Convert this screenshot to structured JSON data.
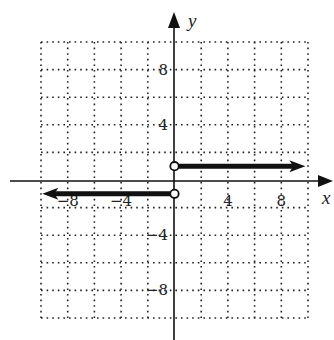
{
  "chart_data": {
    "type": "line",
    "title": "",
    "xlabel": "x",
    "ylabel": "y",
    "xlim": [
      -10,
      10
    ],
    "ylim": [
      -10,
      10
    ],
    "grid": true,
    "grid_step": 2,
    "x_ticks": [
      {
        "value": -8,
        "label": "−8"
      },
      {
        "value": -4,
        "label": "−4"
      },
      {
        "value": 4,
        "label": "4"
      },
      {
        "value": 8,
        "label": "8"
      }
    ],
    "y_ticks": [
      {
        "value": 8,
        "label": "8"
      },
      {
        "value": 4,
        "label": "4"
      },
      {
        "value": -4,
        "label": "−4"
      },
      {
        "value": -8,
        "label": "−8"
      }
    ],
    "series": [
      {
        "name": "y = 1 for x > 0",
        "x": [
          0,
          9.8
        ],
        "y": [
          1,
          1
        ],
        "start_marker": "open-circle",
        "end_marker": "arrow"
      },
      {
        "name": "y = -1 for x < 0",
        "x": [
          0,
          -9.9
        ],
        "y": [
          -1,
          -1
        ],
        "start_marker": "open-circle",
        "end_marker": "arrow"
      }
    ]
  },
  "colors": {
    "ink": "#111111",
    "grid": "#222222",
    "background": "#ffffff"
  }
}
